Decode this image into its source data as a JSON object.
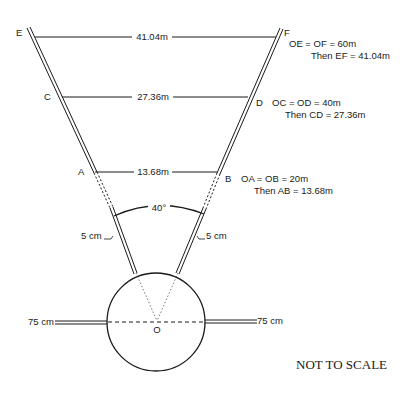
{
  "points": {
    "E": "E",
    "F": "F",
    "C": "C",
    "D": "D",
    "A": "A",
    "B": "B",
    "O": "O"
  },
  "measurements": {
    "EF": "41.04m",
    "CD": "27.36m",
    "AB": "13.68m",
    "angle": "40°",
    "left_width": "5 cm",
    "right_width": "5 cm",
    "left_arm": "75 cm",
    "right_arm": "75 cm"
  },
  "annotations": {
    "EF_line1": "OE = OF = 60m",
    "EF_line2": "Then EF = 41.04m",
    "CD_line1": "OC = OD = 40m",
    "CD_line2": "Then CD = 27.36m",
    "AB_line1": "OA = OB = 20m",
    "AB_line2": "Then AB = 13.68m"
  },
  "note": "NOT TO SCALE",
  "colors": {
    "ink": "#1a1a1a",
    "background": "#ffffff"
  }
}
